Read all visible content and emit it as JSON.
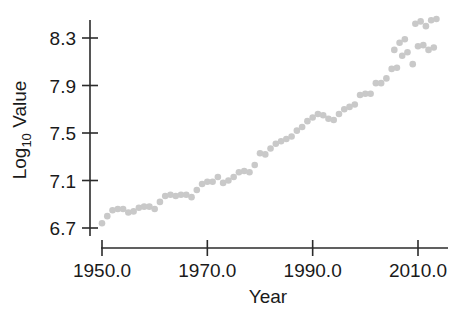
{
  "chart_data": {
    "type": "scatter",
    "title": "",
    "xlabel": "Year",
    "ylabel": "Log10 Value",
    "ylabel_main": "Log",
    "ylabel_sub": "10",
    "ylabel_tail": " Value",
    "xlim": [
      1948.0,
      2014.5
    ],
    "ylim": [
      6.6,
      8.52
    ],
    "grid": false,
    "legend": null,
    "marker": "circle",
    "marker_color": "#c9c9c9",
    "marker_size": 3.3,
    "axis_color": "#2b2b2b",
    "background_color": "#ffffff",
    "xticks": [
      1950.0,
      1970.0,
      1990.0,
      2010.0
    ],
    "xtick_labels": [
      "1950.0",
      "1970.0",
      "1990.0",
      "2010.0"
    ],
    "yticks": [
      6.7,
      7.1,
      7.5,
      7.9,
      8.3
    ],
    "ytick_labels": [
      "6.7",
      "7.1",
      "7.5",
      "7.9",
      "8.3"
    ],
    "x": [
      1950,
      1951,
      1952,
      1953,
      1954,
      1955,
      1956,
      1957,
      1958,
      1959,
      1960,
      1961,
      1962,
      1963,
      1964,
      1965,
      1966,
      1967,
      1968,
      1969,
      1970,
      1971,
      1972,
      1973,
      1974,
      1975,
      1976,
      1977,
      1978,
      1979,
      1980,
      1981,
      1982,
      1983,
      1984,
      1985,
      1986,
      1987,
      1988,
      1989,
      1990,
      1991,
      1992,
      1993,
      1994,
      1995,
      1996,
      1997,
      1998,
      1999,
      2000,
      2001,
      2002,
      2003,
      2004,
      2005,
      2006,
      2007,
      2008,
      2009,
      2010,
      2011,
      2012,
      2013
    ],
    "y": [
      6.74,
      6.8,
      6.85,
      6.86,
      6.86,
      6.83,
      6.84,
      6.87,
      6.88,
      6.88,
      6.86,
      6.92,
      6.97,
      6.98,
      6.97,
      6.98,
      6.98,
      6.96,
      7.02,
      7.07,
      7.09,
      7.09,
      7.13,
      7.08,
      7.1,
      7.13,
      7.17,
      7.18,
      7.17,
      7.23,
      7.33,
      7.32,
      7.37,
      7.41,
      7.43,
      7.45,
      7.47,
      7.52,
      7.55,
      7.6,
      7.63,
      7.66,
      7.65,
      7.62,
      7.61,
      7.66,
      7.7,
      7.72,
      7.74,
      7.82,
      7.83,
      7.83,
      7.92,
      7.92,
      7.96,
      8.04,
      8.05,
      8.15,
      8.18,
      8.08,
      8.23,
      8.24,
      8.2,
      8.22
    ],
    "y_extra_x": [
      2005.5,
      2006.5,
      2007.5,
      2009.5,
      2010.5,
      2011.5,
      2012.5,
      2013.5
    ],
    "y_extra": [
      8.2,
      8.26,
      8.29,
      8.42,
      8.44,
      8.4,
      8.45,
      8.46
    ],
    "n_points": 64,
    "x_range_described": "1950 to 2013",
    "y_range_described": "6.74 to 8.46"
  },
  "axes": {
    "y_axis_name": "y-axis",
    "x_axis_name": "x-axis"
  }
}
